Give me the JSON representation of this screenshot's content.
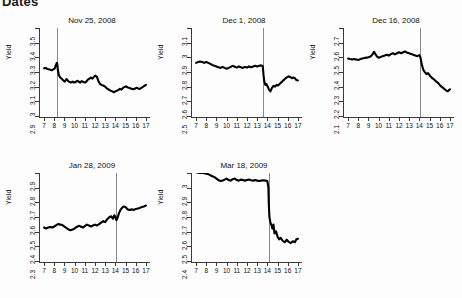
{
  "figure": {
    "title": "Dates",
    "ylabel": "Yield",
    "xticks": [
      "7",
      "8",
      "9",
      "10",
      "11",
      "12",
      "13",
      "14",
      "15",
      "16",
      "17"
    ],
    "line_color": "#000000",
    "vline_color": "#8a8a8a",
    "axis_color": "#3a3a3a"
  },
  "chart_data": {
    "type": "line",
    "title": "Dates",
    "xlabel": "",
    "ylabel": "Yield",
    "grid": false,
    "legend": "none",
    "panels": [
      {
        "title": "Nov 25, 2008",
        "ylabel": "Yield",
        "xlim": [
          6.6,
          17.4
        ],
        "ylim": [
          2.9,
          3.5
        ],
        "yticks": [
          "2.9",
          "3",
          "3.1",
          "3.2",
          "3.3",
          "3.4",
          "3.5"
        ],
        "xticks": [
          "7",
          "8",
          "9",
          "10",
          "11",
          "12",
          "13",
          "14",
          "15",
          "16",
          "17"
        ],
        "vline_x": 8.3,
        "series": [
          {
            "name": "Yield",
            "x": [
              7.0,
              7.15,
              7.3,
              7.45,
              7.6,
              7.75,
              7.9,
              8.05,
              8.15,
              8.25,
              8.3,
              8.35,
              8.45,
              8.6,
              8.75,
              8.9,
              9.05,
              9.2,
              9.35,
              9.5,
              9.65,
              9.8,
              9.95,
              10.1,
              10.25,
              10.4,
              10.55,
              10.7,
              10.85,
              11.0,
              11.15,
              11.3,
              11.45,
              11.6,
              11.75,
              11.9,
              12.05,
              12.2,
              12.35,
              12.5,
              12.65,
              12.8,
              12.95,
              13.1,
              13.25,
              13.4,
              13.55,
              13.7,
              13.85,
              14.0,
              14.15,
              14.3,
              14.45,
              14.6,
              14.75,
              14.9,
              15.05,
              15.2,
              15.35,
              15.5,
              15.65,
              15.8,
              15.95,
              16.1,
              16.25,
              16.4,
              16.55,
              16.7,
              16.85,
              17.0
            ],
            "y": [
              3.225,
              3.228,
              3.222,
              3.218,
              3.215,
              3.212,
              3.218,
              3.225,
              3.245,
              3.262,
              3.255,
              3.215,
              3.178,
              3.162,
              3.152,
              3.142,
              3.135,
              3.152,
              3.14,
              3.132,
              3.128,
              3.135,
              3.128,
              3.132,
              3.14,
              3.135,
              3.128,
              3.138,
              3.132,
              3.128,
              3.135,
              3.148,
              3.155,
              3.162,
              3.155,
              3.168,
              3.175,
              3.165,
              3.135,
              3.118,
              3.112,
              3.108,
              3.102,
              3.092,
              3.085,
              3.078,
              3.072,
              3.068,
              3.062,
              3.068,
              3.072,
              3.078,
              3.085,
              3.08,
              3.092,
              3.098,
              3.102,
              3.095,
              3.092,
              3.088,
              3.085,
              3.082,
              3.088,
              3.092,
              3.088,
              3.085,
              3.092,
              3.098,
              3.105,
              3.112
            ]
          }
        ]
      },
      {
        "title": "Dec 1, 2008",
        "ylabel": "Yield",
        "xlim": [
          6.6,
          17.4
        ],
        "ylim": [
          2.5,
          3.1
        ],
        "yticks": [
          "2.5",
          "2.6",
          "2.7",
          "2.8",
          "2.9",
          "3",
          "3.1"
        ],
        "xticks": [
          "7",
          "8",
          "9",
          "10",
          "11",
          "12",
          "13",
          "14",
          "15",
          "16",
          "17"
        ],
        "vline_x": 13.6,
        "series": [
          {
            "name": "Yield",
            "x": [
              7.0,
              7.2,
              7.4,
              7.6,
              7.8,
              8.0,
              8.2,
              8.4,
              8.6,
              8.8,
              9.0,
              9.2,
              9.4,
              9.6,
              9.8,
              10.0,
              10.2,
              10.4,
              10.6,
              10.8,
              11.0,
              11.2,
              11.4,
              11.6,
              11.8,
              12.0,
              12.2,
              12.4,
              12.6,
              12.8,
              13.0,
              13.2,
              13.4,
              13.55,
              13.62,
              13.7,
              13.8,
              13.9,
              14.0,
              14.15,
              14.3,
              14.45,
              14.6,
              14.75,
              14.9,
              15.05,
              15.2,
              15.35,
              15.5,
              15.65,
              15.8,
              15.95,
              16.1,
              16.25,
              16.4,
              16.55,
              16.7,
              16.85,
              17.0
            ],
            "y": [
              2.862,
              2.868,
              2.872,
              2.868,
              2.862,
              2.868,
              2.862,
              2.855,
              2.848,
              2.842,
              2.838,
              2.832,
              2.828,
              2.835,
              2.828,
              2.822,
              2.828,
              2.835,
              2.842,
              2.836,
              2.83,
              2.838,
              2.832,
              2.828,
              2.835,
              2.83,
              2.838,
              2.832,
              2.838,
              2.842,
              2.838,
              2.842,
              2.845,
              2.84,
              2.78,
              2.735,
              2.712,
              2.718,
              2.705,
              2.682,
              2.668,
              2.692,
              2.705,
              2.7,
              2.712,
              2.708,
              2.718,
              2.728,
              2.738,
              2.748,
              2.758,
              2.765,
              2.77,
              2.766,
              2.758,
              2.762,
              2.758,
              2.745,
              2.742
            ]
          }
        ]
      },
      {
        "title": "Dec 16, 2008",
        "ylabel": "Yield",
        "xlim": [
          6.6,
          17.4
        ],
        "ylim": [
          2.1,
          2.7
        ],
        "yticks": [
          "2.1",
          "2.2",
          "2.3",
          "2.4",
          "2.5",
          "2.6",
          "2.7"
        ],
        "xticks": [
          "7",
          "8",
          "9",
          "10",
          "11",
          "12",
          "13",
          "14",
          "15",
          "16",
          "17"
        ],
        "vline_x": 14.1,
        "series": [
          {
            "name": "Yield",
            "x": [
              7.0,
              7.2,
              7.4,
              7.6,
              7.8,
              8.0,
              8.2,
              8.4,
              8.6,
              8.8,
              9.0,
              9.2,
              9.4,
              9.55,
              9.7,
              9.85,
              10.0,
              10.2,
              10.4,
              10.6,
              10.8,
              11.0,
              11.2,
              11.4,
              11.6,
              11.8,
              12.0,
              12.2,
              12.4,
              12.6,
              12.8,
              13.0,
              13.2,
              13.4,
              13.6,
              13.8,
              14.0,
              14.1,
              14.25,
              14.4,
              14.55,
              14.7,
              14.85,
              15.0,
              15.2,
              15.4,
              15.6,
              15.8,
              16.0,
              16.2,
              16.4,
              16.6,
              16.8,
              17.0
            ],
            "y": [
              2.492,
              2.488,
              2.485,
              2.488,
              2.485,
              2.482,
              2.488,
              2.492,
              2.495,
              2.498,
              2.5,
              2.505,
              2.52,
              2.538,
              2.52,
              2.505,
              2.498,
              2.502,
              2.508,
              2.512,
              2.518,
              2.512,
              2.522,
              2.528,
              2.52,
              2.528,
              2.535,
              2.528,
              2.535,
              2.54,
              2.532,
              2.528,
              2.522,
              2.518,
              2.512,
              2.508,
              2.515,
              2.5,
              2.448,
              2.412,
              2.398,
              2.385,
              2.392,
              2.378,
              2.362,
              2.352,
              2.338,
              2.328,
              2.312,
              2.298,
              2.288,
              2.275,
              2.268,
              2.282
            ]
          }
        ]
      },
      {
        "title": "Jan 28, 2009",
        "ylabel": "Yield",
        "xlim": [
          6.6,
          17.4
        ],
        "ylim": [
          2.3,
          2.9
        ],
        "yticks": [
          "2.3",
          "2.4",
          "2.5",
          "2.6",
          "2.7",
          "2.8",
          "2.9"
        ],
        "xticks": [
          "7",
          "8",
          "9",
          "10",
          "11",
          "12",
          "13",
          "14",
          "15",
          "16",
          "17"
        ],
        "vline_x": 14.1,
        "series": [
          {
            "name": "Yield",
            "x": [
              7.0,
              7.2,
              7.4,
              7.6,
              7.8,
              8.0,
              8.2,
              8.4,
              8.6,
              8.8,
              9.0,
              9.2,
              9.4,
              9.6,
              9.8,
              10.0,
              10.2,
              10.4,
              10.6,
              10.8,
              11.0,
              11.2,
              11.4,
              11.6,
              11.8,
              12.0,
              12.2,
              12.4,
              12.6,
              12.8,
              13.0,
              13.2,
              13.4,
              13.6,
              13.75,
              13.9,
              14.0,
              14.1,
              14.2,
              14.35,
              14.5,
              14.65,
              14.8,
              15.0,
              15.2,
              15.4,
              15.6,
              15.8,
              16.0,
              16.2,
              16.4,
              16.6,
              16.8,
              17.0
            ],
            "y": [
              2.528,
              2.522,
              2.528,
              2.532,
              2.528,
              2.535,
              2.545,
              2.552,
              2.548,
              2.545,
              2.535,
              2.525,
              2.515,
              2.51,
              2.515,
              2.522,
              2.532,
              2.54,
              2.535,
              2.528,
              2.538,
              2.548,
              2.542,
              2.535,
              2.542,
              2.548,
              2.542,
              2.552,
              2.562,
              2.572,
              2.565,
              2.585,
              2.598,
              2.605,
              2.588,
              2.612,
              2.598,
              2.578,
              2.592,
              2.625,
              2.648,
              2.662,
              2.672,
              2.668,
              2.652,
              2.648,
              2.652,
              2.648,
              2.655,
              2.658,
              2.662,
              2.668,
              2.672,
              2.678
            ]
          }
        ]
      },
      {
        "title": "Mar 18, 2009",
        "ylabel": "Yield",
        "xlim": [
          6.6,
          17.4
        ],
        "ylim": [
          2.4,
          3.0
        ],
        "yticks": [
          "2.4",
          "2.5",
          "2.6",
          "2.7",
          "2.8",
          "2.9",
          "3"
        ],
        "xticks": [
          "7",
          "8",
          "9",
          "10",
          "11",
          "12",
          "13",
          "14",
          "15",
          "16",
          "17"
        ],
        "vline_x": 14.15,
        "series": [
          {
            "name": "Yield",
            "x": [
              7.0,
              7.2,
              7.4,
              7.6,
              7.8,
              8.0,
              8.2,
              8.4,
              8.6,
              8.8,
              9.0,
              9.2,
              9.4,
              9.6,
              9.8,
              10.0,
              10.2,
              10.4,
              10.6,
              10.8,
              11.0,
              11.2,
              11.4,
              11.6,
              11.8,
              12.0,
              12.2,
              12.4,
              12.6,
              12.8,
              13.0,
              13.2,
              13.4,
              13.6,
              13.8,
              14.0,
              14.1,
              14.15,
              14.2,
              14.3,
              14.4,
              14.5,
              14.6,
              14.7,
              14.85,
              15.0,
              15.15,
              15.3,
              15.5,
              15.7,
              15.9,
              16.1,
              16.3,
              16.5,
              16.7,
              16.85,
              17.0
            ],
            "y": [
              3.005,
              3.002,
              3.0,
              3.002,
              2.998,
              2.995,
              2.992,
              2.985,
              2.978,
              2.972,
              2.962,
              2.952,
              2.945,
              2.948,
              2.955,
              2.962,
              2.952,
              2.948,
              2.958,
              2.962,
              2.952,
              2.948,
              2.955,
              2.952,
              2.948,
              2.952,
              2.955,
              2.95,
              2.948,
              2.952,
              2.948,
              2.945,
              2.948,
              2.95,
              2.948,
              2.945,
              2.9,
              2.77,
              2.7,
              2.662,
              2.645,
              2.62,
              2.648,
              2.588,
              2.602,
              2.565,
              2.548,
              2.558,
              2.538,
              2.528,
              2.545,
              2.53,
              2.522,
              2.535,
              2.528,
              2.548,
              2.552
            ]
          }
        ]
      }
    ]
  }
}
